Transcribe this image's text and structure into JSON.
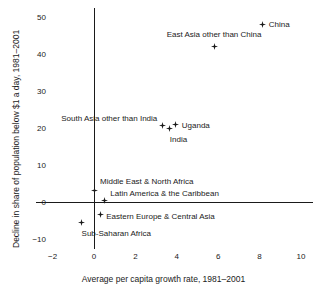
{
  "chart_data": {
    "type": "scatter",
    "title": "",
    "xlabel": "Average per capita growth rate, 1981–2001",
    "ylabel": "Decline in share of population below $1 a day, 1981–2001",
    "xlim": [
      -2.8,
      10.6
    ],
    "ylim": [
      -11.5,
      52.5
    ],
    "xticks": [
      -2,
      0,
      2,
      4,
      6,
      8,
      10
    ],
    "xtick_labels": [
      "−2",
      "0",
      "2",
      "4",
      "6",
      "8",
      "10"
    ],
    "yticks": [
      -10,
      0,
      10,
      20,
      30,
      40,
      50
    ],
    "ytick_labels": [
      "−10",
      "0",
      "10",
      "20",
      "30",
      "40",
      "50"
    ],
    "grid": false,
    "legend": "none",
    "marker": "star",
    "marker_color": "#1a1a1a",
    "axis_color": "#1a1a1a",
    "points": [
      {
        "name": "China",
        "x": 8.15,
        "y": 48.0,
        "label": "China",
        "label_pos": "right",
        "label_dx": 6,
        "label_dy": 0
      },
      {
        "name": "East Asia other than China",
        "x": 5.8,
        "y": 42.0,
        "label": "East Asia other than China",
        "label_pos": "center",
        "label_dx": 0,
        "label_dy": -13
      },
      {
        "name": "South Asia other than India",
        "x": 3.3,
        "y": 20.6,
        "label": "South Asia other than India",
        "label_pos": "left",
        "label_dx": -5,
        "label_dy": -8
      },
      {
        "name": "Uganda",
        "x": 3.95,
        "y": 21.0,
        "label": "Uganda",
        "label_pos": "right",
        "label_dx": 6,
        "label_dy": 1
      },
      {
        "name": "India",
        "x": 3.65,
        "y": 19.9,
        "label": "India",
        "label_pos": "center",
        "label_dx": 9,
        "label_dy": 11
      },
      {
        "name": "Middle East & North Africa",
        "x": 0.0,
        "y": 3.0,
        "label": "Middle East & North Africa",
        "label_pos": "right",
        "label_dx": 6,
        "label_dy": -10
      },
      {
        "name": "Latin America & the Caribbean",
        "x": 0.5,
        "y": 0.3,
        "label": "Latin America & the Caribbean",
        "label_pos": "right",
        "label_dx": 6,
        "label_dy": -8
      },
      {
        "name": "Eastern Europe & Central Asia",
        "x": 0.3,
        "y": -3.5,
        "label": "Eastern Europe & Central Asia",
        "label_pos": "right",
        "label_dx": 6,
        "label_dy": 1
      },
      {
        "name": "Sub-Saharan Africa",
        "x": -0.6,
        "y": -5.5,
        "label": "Sub-Saharan Africa",
        "label_pos": "right",
        "label_dx": 0,
        "label_dy": 11
      }
    ]
  }
}
